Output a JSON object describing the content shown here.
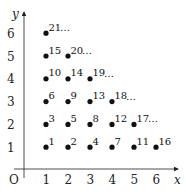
{
  "chart_data": {
    "type": "scatter",
    "title": "",
    "xlabel": "x",
    "ylabel": "y",
    "origin_label": "O",
    "xlim": [
      0,
      6.5
    ],
    "ylim": [
      0,
      6.5
    ],
    "x_ticks": [
      "1",
      "2",
      "3",
      "4",
      "5",
      "6"
    ],
    "y_ticks": [
      "1",
      "2",
      "3",
      "4",
      "5",
      "6"
    ],
    "grid": false,
    "points": [
      {
        "x": 1,
        "y": 1,
        "label": "1"
      },
      {
        "x": 2,
        "y": 1,
        "label": "2"
      },
      {
        "x": 1,
        "y": 2,
        "label": "3"
      },
      {
        "x": 3,
        "y": 1,
        "label": "4"
      },
      {
        "x": 2,
        "y": 2,
        "label": "5"
      },
      {
        "x": 1,
        "y": 3,
        "label": "6"
      },
      {
        "x": 4,
        "y": 1,
        "label": "7"
      },
      {
        "x": 3,
        "y": 2,
        "label": "8"
      },
      {
        "x": 2,
        "y": 3,
        "label": "9"
      },
      {
        "x": 1,
        "y": 4,
        "label": "10"
      },
      {
        "x": 5,
        "y": 1,
        "label": "11"
      },
      {
        "x": 4,
        "y": 2,
        "label": "12"
      },
      {
        "x": 3,
        "y": 3,
        "label": "13"
      },
      {
        "x": 2,
        "y": 4,
        "label": "14"
      },
      {
        "x": 1,
        "y": 5,
        "label": "15"
      },
      {
        "x": 6,
        "y": 1,
        "label": "16"
      },
      {
        "x": 5,
        "y": 2,
        "label": "17"
      },
      {
        "x": 4,
        "y": 3,
        "label": "18"
      },
      {
        "x": 3,
        "y": 4,
        "label": "19"
      },
      {
        "x": 2,
        "y": 5,
        "label": "20"
      },
      {
        "x": 1,
        "y": 6,
        "label": "21"
      }
    ],
    "annotations": [
      {
        "text": "…",
        "row": 6,
        "after_x": 1
      },
      {
        "text": "…",
        "row": 5,
        "after_x": 2
      },
      {
        "text": "…",
        "row": 4,
        "after_x": 3
      },
      {
        "text": "…",
        "row": 3,
        "after_x": 4
      },
      {
        "text": "…",
        "row": 2,
        "after_x": 5
      }
    ]
  }
}
